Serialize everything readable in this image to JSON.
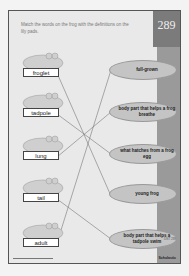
{
  "page": {
    "number": "289",
    "instructions": "Match the words on the frog with the definitions on the lily pads.",
    "footer_brand": "Scholastic",
    "small_code": "DNT 289"
  },
  "frogs": [
    {
      "word": "froglet",
      "top": 40
    },
    {
      "word": "tadpole",
      "top": 80
    },
    {
      "word": "lung",
      "top": 123
    },
    {
      "word": "tail",
      "top": 165
    },
    {
      "word": "adult",
      "top": 210
    }
  ],
  "lily_pads": [
    {
      "definition": "full-grown",
      "top": 49
    },
    {
      "definition": "body part that helps a frog breathe",
      "top": 91
    },
    {
      "definition": "what hatches from a frog egg",
      "top": 133
    },
    {
      "definition": "young frog",
      "top": 173
    },
    {
      "definition": "body part that helps a tadpole swim",
      "top": 218
    }
  ],
  "matches": [
    {
      "word": "froglet",
      "definition": "young frog"
    },
    {
      "word": "tadpole",
      "definition": "what hatches from a frog egg"
    },
    {
      "word": "lung",
      "definition": "body part that helps a frog breathe"
    },
    {
      "word": "tail",
      "definition": "body part that helps a tadpole swim"
    },
    {
      "word": "adult",
      "definition": "full-grown"
    }
  ],
  "colors": {
    "page_bg": "#e9e9e9",
    "stripe": "#9a9a9a",
    "lily_pad": "#c4c4c4",
    "line": "#777777"
  }
}
